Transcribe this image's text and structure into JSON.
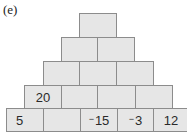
{
  "label": "(e)",
  "pyramid": {
    "rows": [
      [
        "",
        "",
        "",
        "",
        ""
      ],
      [
        "",
        "",
        "",
        ""
      ],
      [
        "",
        "",
        ""
      ],
      [
        "",
        ""
      ],
      [
        ""
      ]
    ],
    "row5": [
      "5",
      "",
      "−15",
      "−3",
      "12"
    ],
    "row4": [
      "20",
      "",
      "",
      ""
    ],
    "row3": [
      "",
      "",
      ""
    ],
    "row2": [
      "",
      ""
    ],
    "row1": [
      ""
    ]
  },
  "colors": {
    "brick_fill": "#e6e6e6",
    "brick_border": "#8c8c8c"
  }
}
